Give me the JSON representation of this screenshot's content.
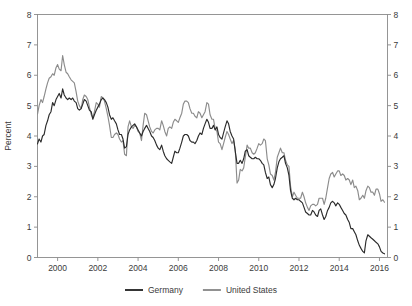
{
  "chart_data": {
    "type": "line",
    "title": "",
    "xlabel": "",
    "ylabel": "Percent",
    "xlim": [
      1999.0,
      2016.4
    ],
    "ylim": [
      0,
      8
    ],
    "grid": false,
    "legend_position": "bottom-center",
    "xticks": [
      "2000",
      "2002",
      "2004",
      "2006",
      "2008",
      "2010",
      "2012",
      "2014",
      "2016"
    ],
    "xtick_values": [
      2000,
      2002,
      2004,
      2006,
      2008,
      2010,
      2012,
      2014,
      2016
    ],
    "yticks": [
      "0",
      "1",
      "2",
      "3",
      "4",
      "5",
      "6",
      "7",
      "8"
    ],
    "ytick_values": [
      0,
      1,
      2,
      3,
      4,
      5,
      6,
      7,
      8
    ],
    "y_axis_right_mirrored": true,
    "colors": {
      "germany": "#2b2b2b",
      "united_states": "#8c8c8c",
      "axis": "#8a8a8a",
      "text": "#3b3b3b"
    },
    "x": [
      1999.0,
      1999.08,
      1999.17,
      1999.25,
      1999.33,
      1999.42,
      1999.5,
      1999.58,
      1999.67,
      1999.75,
      1999.83,
      1999.92,
      2000.0,
      2000.08,
      2000.17,
      2000.25,
      2000.33,
      2000.42,
      2000.5,
      2000.58,
      2000.67,
      2000.75,
      2000.83,
      2000.92,
      2001.0,
      2001.08,
      2001.17,
      2001.25,
      2001.33,
      2001.42,
      2001.5,
      2001.58,
      2001.67,
      2001.75,
      2001.83,
      2001.92,
      2002.0,
      2002.08,
      2002.17,
      2002.25,
      2002.33,
      2002.42,
      2002.5,
      2002.58,
      2002.67,
      2002.75,
      2002.83,
      2002.92,
      2003.0,
      2003.08,
      2003.17,
      2003.25,
      2003.33,
      2003.42,
      2003.5,
      2003.58,
      2003.67,
      2003.75,
      2003.83,
      2003.92,
      2004.0,
      2004.08,
      2004.17,
      2004.25,
      2004.33,
      2004.42,
      2004.5,
      2004.58,
      2004.67,
      2004.75,
      2004.83,
      2004.92,
      2005.0,
      2005.08,
      2005.17,
      2005.25,
      2005.33,
      2005.42,
      2005.5,
      2005.58,
      2005.67,
      2005.75,
      2005.83,
      2005.92,
      2006.0,
      2006.08,
      2006.17,
      2006.25,
      2006.33,
      2006.42,
      2006.5,
      2006.58,
      2006.67,
      2006.75,
      2006.83,
      2006.92,
      2007.0,
      2007.08,
      2007.17,
      2007.25,
      2007.33,
      2007.42,
      2007.5,
      2007.58,
      2007.67,
      2007.75,
      2007.83,
      2007.92,
      2008.0,
      2008.08,
      2008.17,
      2008.25,
      2008.33,
      2008.42,
      2008.5,
      2008.58,
      2008.67,
      2008.75,
      2008.83,
      2008.92,
      2009.0,
      2009.08,
      2009.17,
      2009.25,
      2009.33,
      2009.42,
      2009.5,
      2009.58,
      2009.67,
      2009.75,
      2009.83,
      2009.92,
      2010.0,
      2010.08,
      2010.17,
      2010.25,
      2010.33,
      2010.42,
      2010.5,
      2010.58,
      2010.67,
      2010.75,
      2010.83,
      2010.92,
      2011.0,
      2011.08,
      2011.17,
      2011.25,
      2011.33,
      2011.42,
      2011.5,
      2011.58,
      2011.67,
      2011.75,
      2011.83,
      2011.92,
      2012.0,
      2012.08,
      2012.17,
      2012.25,
      2012.33,
      2012.42,
      2012.5,
      2012.58,
      2012.67,
      2012.75,
      2012.83,
      2012.92,
      2013.0,
      2013.08,
      2013.17,
      2013.25,
      2013.33,
      2013.42,
      2013.5,
      2013.58,
      2013.67,
      2013.75,
      2013.83,
      2013.92,
      2014.0,
      2014.08,
      2014.17,
      2014.25,
      2014.33,
      2014.42,
      2014.5,
      2014.58,
      2014.67,
      2014.75,
      2014.83,
      2014.92,
      2015.0,
      2015.08,
      2015.17,
      2015.25,
      2015.33,
      2015.42,
      2015.5,
      2015.58,
      2015.67,
      2015.75,
      2015.83,
      2015.92,
      2016.0,
      2016.08,
      2016.17,
      2016.25
    ],
    "series": [
      {
        "name": "Germany",
        "color": "#2b2b2b",
        "values": [
          3.74,
          3.9,
          3.8,
          4.0,
          4.05,
          4.35,
          4.5,
          4.7,
          4.8,
          5.1,
          5.0,
          5.2,
          5.3,
          5.4,
          5.25,
          5.55,
          5.35,
          5.25,
          5.2,
          5.25,
          5.2,
          5.25,
          5.15,
          5.1,
          4.9,
          4.85,
          4.9,
          5.05,
          5.2,
          5.15,
          5.0,
          4.85,
          4.8,
          4.55,
          4.7,
          4.85,
          4.95,
          5.05,
          5.2,
          5.25,
          5.2,
          5.1,
          4.95,
          4.7,
          4.55,
          4.6,
          4.5,
          4.4,
          4.2,
          4.05,
          4.05,
          3.9,
          3.6,
          3.65,
          4.05,
          4.2,
          4.3,
          4.35,
          4.4,
          4.3,
          4.2,
          4.1,
          4.0,
          4.15,
          4.25,
          4.35,
          4.25,
          4.15,
          4.0,
          3.95,
          3.85,
          3.7,
          3.6,
          3.55,
          3.7,
          3.5,
          3.35,
          3.25,
          3.2,
          3.15,
          3.1,
          3.3,
          3.5,
          3.45,
          3.45,
          3.6,
          3.8,
          4.0,
          4.05,
          4.05,
          4.0,
          3.85,
          3.8,
          3.8,
          3.75,
          3.85,
          4.0,
          4.1,
          4.05,
          4.25,
          4.4,
          4.55,
          4.45,
          4.25,
          4.25,
          4.35,
          4.2,
          4.3,
          4.05,
          3.95,
          3.9,
          4.1,
          4.3,
          4.5,
          4.4,
          4.15,
          4.0,
          3.9,
          3.5,
          3.1,
          3.1,
          3.2,
          3.1,
          3.25,
          3.5,
          3.55,
          3.35,
          3.3,
          3.25,
          3.25,
          3.3,
          3.25,
          3.25,
          3.2,
          3.1,
          3.05,
          2.8,
          2.6,
          2.65,
          2.4,
          2.3,
          2.4,
          2.6,
          2.95,
          3.15,
          3.25,
          3.3,
          3.35,
          3.1,
          2.95,
          2.7,
          2.2,
          1.95,
          1.9,
          1.95,
          1.9,
          1.9,
          1.85,
          1.8,
          1.65,
          1.5,
          1.45,
          1.4,
          1.4,
          1.55,
          1.5,
          1.4,
          1.35,
          1.55,
          1.6,
          1.4,
          1.25,
          1.35,
          1.55,
          1.65,
          1.8,
          1.85,
          1.8,
          1.7,
          1.8,
          1.75,
          1.65,
          1.55,
          1.45,
          1.4,
          1.25,
          1.15,
          0.95,
          0.95,
          0.85,
          0.75,
          0.55,
          0.4,
          0.3,
          0.2,
          0.15,
          0.55,
          0.75,
          0.7,
          0.65,
          0.6,
          0.55,
          0.5,
          0.45,
          0.35,
          0.2,
          0.15,
          0.12
        ]
      },
      {
        "name": "United States",
        "color": "#8c8c8c",
        "values": [
          4.72,
          5.0,
          5.2,
          5.1,
          5.3,
          5.55,
          5.75,
          5.9,
          5.95,
          6.05,
          6.0,
          6.25,
          6.35,
          6.2,
          6.15,
          6.65,
          6.35,
          6.1,
          6.05,
          5.95,
          5.85,
          5.8,
          5.75,
          5.45,
          5.15,
          5.0,
          4.9,
          5.2,
          5.35,
          5.3,
          5.2,
          4.95,
          4.7,
          4.6,
          4.8,
          5.1,
          5.05,
          4.95,
          5.3,
          5.25,
          5.15,
          4.9,
          4.65,
          4.35,
          3.95,
          3.95,
          4.05,
          4.1,
          4.05,
          3.9,
          3.8,
          3.85,
          3.4,
          3.35,
          4.3,
          4.5,
          4.3,
          4.25,
          4.35,
          4.3,
          4.15,
          4.1,
          3.85,
          4.35,
          4.75,
          4.7,
          4.5,
          4.3,
          4.15,
          4.1,
          4.2,
          4.25,
          4.25,
          4.2,
          4.5,
          4.35,
          4.15,
          4.0,
          4.25,
          4.3,
          4.25,
          4.45,
          4.55,
          4.5,
          4.45,
          4.6,
          4.75,
          5.05,
          5.15,
          5.15,
          5.1,
          4.9,
          4.75,
          4.75,
          4.65,
          4.6,
          4.8,
          4.75,
          4.6,
          4.7,
          4.8,
          5.1,
          5.05,
          4.7,
          4.55,
          4.55,
          4.25,
          4.15,
          3.8,
          3.75,
          3.55,
          3.75,
          3.95,
          4.15,
          4.05,
          3.9,
          3.75,
          3.85,
          3.55,
          2.45,
          2.55,
          2.9,
          2.85,
          2.95,
          3.3,
          3.7,
          3.6,
          3.6,
          3.45,
          3.4,
          3.45,
          3.6,
          3.75,
          3.7,
          3.75,
          3.9,
          3.85,
          3.25,
          3.05,
          2.75,
          2.7,
          2.55,
          2.8,
          3.3,
          3.45,
          3.6,
          3.45,
          3.45,
          3.2,
          3.05,
          3.0,
          2.35,
          2.0,
          2.15,
          2.05,
          1.95,
          1.95,
          1.95,
          2.15,
          2.0,
          1.8,
          1.65,
          1.55,
          1.7,
          1.75,
          1.75,
          1.7,
          1.75,
          1.95,
          1.95,
          1.95,
          1.75,
          1.95,
          2.3,
          2.6,
          2.75,
          2.8,
          2.65,
          2.75,
          2.85,
          2.85,
          2.7,
          2.75,
          2.7,
          2.55,
          2.6,
          2.55,
          2.4,
          2.55,
          2.3,
          2.35,
          2.2,
          1.9,
          1.95,
          2.05,
          1.95,
          2.2,
          2.35,
          2.3,
          2.15,
          2.15,
          2.05,
          2.25,
          2.25,
          2.1,
          1.85,
          1.9,
          1.82
        ]
      }
    ]
  },
  "legend": {
    "items": [
      {
        "label": "Germany",
        "color": "#2b2b2b"
      },
      {
        "label": "United States",
        "color": "#8c8c8c"
      }
    ]
  }
}
